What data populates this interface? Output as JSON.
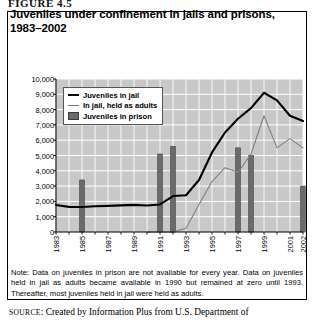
{
  "figure_label": "FIGURE 4.5",
  "title": "Juveniles under confinement in jails and prisons, 1983–2002",
  "note": "Note: Data on juveniles in prison are not available for every year. Data on juveniles held in jail as adults became available in 1990 but remained at zero until 1993. Thereafter, most juveniles held in jail were held as adults.",
  "source_prefix": "SOURCE",
  "source_text": ": Created by Information Plus from U.S. Department of",
  "colors": {
    "jail_line": "#000000",
    "adults_line": "#808080",
    "prison_bar": "#6b6b6b",
    "plot_bg": "#c8c8c8",
    "grid": "#ffffff"
  },
  "chart_data": {
    "type": "line",
    "title": "Juveniles under confinement in jails and prisons, 1983–2002",
    "xlabel": "",
    "ylabel": "",
    "ylim": [
      0,
      10000
    ],
    "ytick_step": 1000,
    "grid": true,
    "legend_position": "upper-left-inside",
    "ytick_labels": [
      "10,000",
      "9,000",
      "8,000",
      "7,000",
      "6,000",
      "5,000",
      "4,000",
      "3,000",
      "2,000",
      "1,000",
      "0"
    ],
    "ytick_values": [
      10000,
      9000,
      8000,
      7000,
      6000,
      5000,
      4000,
      3000,
      2000,
      1000,
      0
    ],
    "x": [
      1983,
      1984,
      1985,
      1986,
      1987,
      1988,
      1989,
      1990,
      1991,
      1992,
      1993,
      1994,
      1995,
      1996,
      1997,
      1998,
      1999,
      2000,
      2001,
      2002
    ],
    "xtick_labels": [
      "1983",
      "1985",
      "1987",
      "1989",
      "1991",
      "1993",
      "1995",
      "1997",
      "1999",
      "2001",
      "2002"
    ],
    "xtick_values": [
      1983,
      1985,
      1987,
      1989,
      1991,
      1993,
      1995,
      1997,
      1999,
      2001,
      2002
    ],
    "series": [
      {
        "name": "Juveniles in jail",
        "style": "line-thick",
        "color": "#000000",
        "values": [
          1760,
          1640,
          1630,
          1680,
          1710,
          1740,
          1770,
          1730,
          1800,
          2350,
          2400,
          3400,
          5200,
          6500,
          7400,
          8100,
          9100,
          8600,
          7600,
          7250
        ]
      },
      {
        "name": "In jail, held as adults",
        "style": "line-thin",
        "color": "#808080",
        "values": [
          null,
          null,
          null,
          null,
          null,
          null,
          null,
          0,
          0,
          0,
          250,
          1800,
          3300,
          4200,
          3900,
          5100,
          7600,
          5500,
          6100,
          5500
        ]
      },
      {
        "name": "Juveniles in prison",
        "style": "bar",
        "color": "#6b6b6b",
        "values": [
          null,
          null,
          3400,
          null,
          null,
          null,
          null,
          null,
          5100,
          5600,
          null,
          null,
          null,
          null,
          5500,
          5000,
          null,
          null,
          null,
          3000
        ]
      }
    ],
    "legend": [
      {
        "label": "Juveniles in jail",
        "marker": "line-thick"
      },
      {
        "label": "In jail, held as adults",
        "marker": "line-thin"
      },
      {
        "label": "Juveniles in prison",
        "marker": "bar"
      }
    ]
  }
}
